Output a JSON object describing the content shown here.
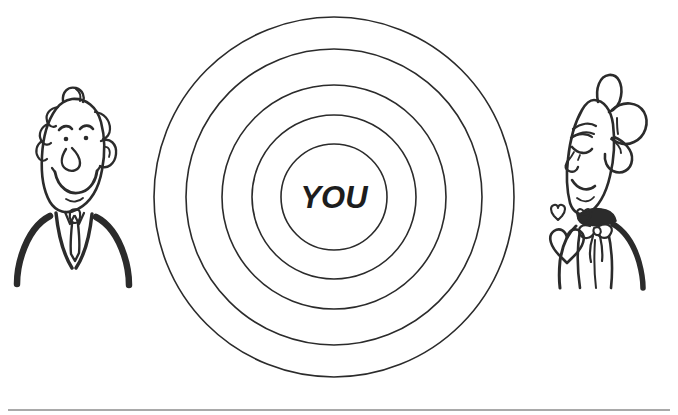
{
  "figure": {
    "kind": "line-art-cartoon-illustration",
    "caption_text": "",
    "background_color": "#ffffff",
    "ink_color": "#2b2b2b",
    "text_color": "#1d1d1d"
  },
  "center_target": {
    "label": "YOU",
    "label_font_size_px": 31,
    "center_x": 334,
    "center_y": 197,
    "ring_count": 5,
    "ring_radii_px": [
      53,
      82,
      112,
      148,
      180
    ],
    "stroke_width_px": 1.6
  },
  "characters": [
    {
      "id": "man-left",
      "name": "smiling-man",
      "side": "left",
      "description": "Smiling man with curly hair tuft, suit jacket and necktie",
      "center_x": 74,
      "head_top_y": 96,
      "features": [
        "curly-hair-tuft",
        "wavy-side-hair",
        "ear",
        "eyebrows",
        "dot-eyes",
        "round-nose",
        "wide-smile",
        "suit-lapels",
        "necktie"
      ]
    },
    {
      "id": "woman-right",
      "name": "happy-woman-with-hearts",
      "side": "right",
      "description": "Woman with large hair bow, closed happy eyes, collar with ribbon bow, floating hearts",
      "center_x": 596,
      "head_top_y": 96,
      "features": [
        "hair-bow",
        "closed-eyes",
        "eyelashes",
        "smile",
        "dark-collar",
        "ribbon-bow",
        "floating-hearts"
      ],
      "heart_count": 3
    }
  ],
  "hearts": [
    {
      "id": "heart-small-upper",
      "x": 554,
      "y": 210,
      "size_px": 11
    },
    {
      "id": "heart-small-neck",
      "x": 583,
      "y": 216,
      "size_px": 10
    },
    {
      "id": "heart-large",
      "x": 564,
      "y": 238,
      "size_px": 24
    }
  ],
  "footer_rule": {
    "present": true,
    "y": 410,
    "x_start": 8,
    "x_end": 670,
    "color": "#8c8c8c",
    "thickness_px": 1.4
  }
}
